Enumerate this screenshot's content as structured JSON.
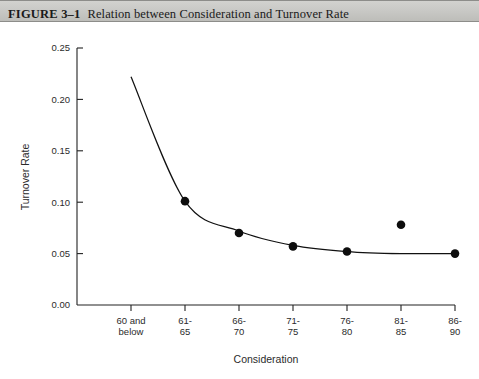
{
  "header": {
    "figure_number": "FIGURE 3–1",
    "caption": "Relation between Consideration and Turnover Rate"
  },
  "chart_data": {
    "type": "scatter",
    "title": "Relation between Consideration and Turnover Rate",
    "xlabel": "Consideration",
    "ylabel": "Turnover Rate",
    "categories": [
      "60 and below",
      "61-65",
      "66-70",
      "71-75",
      "76-80",
      "81-85",
      "86-90"
    ],
    "category_lines": [
      [
        "60 and",
        "below"
      ],
      [
        "61-",
        "65"
      ],
      [
        "66-",
        "70"
      ],
      [
        "71-",
        "75"
      ],
      [
        "76-",
        "80"
      ],
      [
        "81-",
        "85"
      ],
      [
        "86-",
        "90"
      ]
    ],
    "values": [
      null,
      0.101,
      0.07,
      0.057,
      0.052,
      0.078,
      0.05
    ],
    "series": [
      {
        "name": "Observed turnover rate",
        "values": [
          null,
          0.101,
          0.07,
          0.057,
          0.052,
          0.078,
          0.05
        ]
      },
      {
        "name": "Fitted curve",
        "type": "line",
        "x": [
          "60 and below",
          "61-65",
          "66-70",
          "71-75",
          "76-80",
          "81-85",
          "86-90"
        ],
        "values": [
          0.222,
          0.101,
          0.072,
          0.058,
          0.052,
          0.05,
          0.05
        ]
      }
    ],
    "ylim": [
      0.0,
      0.25
    ],
    "ytick_labels": [
      "0.00",
      "0.05",
      "0.10",
      "0.15",
      "0.20",
      "0.25"
    ],
    "ytick_values": [
      0.0,
      0.05,
      0.1,
      0.15,
      0.2,
      0.25
    ],
    "grid": false,
    "legend": null,
    "marker_color": "#0d0d0d",
    "line_color": "#111111",
    "axis_color": "#222222"
  }
}
